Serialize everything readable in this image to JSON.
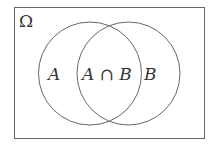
{
  "diagram": {
    "type": "venn",
    "universe": {
      "label": "Ω",
      "rect": {
        "x": 14.5,
        "y": 7.5,
        "width": 190,
        "height": 131
      }
    },
    "sets": [
      {
        "name": "A",
        "label": "A",
        "cx": 90,
        "cy": 73.5,
        "r": 51.5
      },
      {
        "name": "B",
        "label": "B",
        "cx": 128.5,
        "cy": 73.5,
        "r": 51.5
      }
    ],
    "regions": {
      "a_only": "A",
      "intersection": "A ∩ B",
      "b_only": "B"
    },
    "colors": {
      "stroke": "#666666",
      "text": "#333333",
      "background": "#ffffff"
    }
  }
}
